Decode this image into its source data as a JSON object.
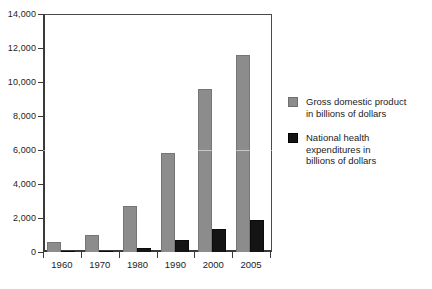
{
  "chart_data": {
    "type": "bar",
    "title": "",
    "subtitle": "",
    "xlabel": "",
    "ylabel": "",
    "categories": [
      "1960",
      "1970",
      "1980",
      "1990",
      "2000",
      "2005"
    ],
    "series": [
      {
        "name": "Gross domestic product in billions of dollars",
        "color": "#8c8c8c",
        "values": [
          600,
          1000,
          2700,
          5800,
          9600,
          11600
        ]
      },
      {
        "name": "National health expenditures in billions of dollars",
        "color": "#141414",
        "values": [
          27,
          75,
          250,
          700,
          1350,
          1900
        ]
      }
    ],
    "ylim": [
      0,
      14000
    ],
    "ytick_step": 2000,
    "ytick_labels": [
      "0",
      "2,000",
      "4,000",
      "6,000",
      "8,000",
      "10,000",
      "12,000",
      "14,000"
    ],
    "ytick_values": [
      0,
      2000,
      4000,
      6000,
      8000,
      10000,
      12000,
      14000
    ],
    "grid": false,
    "legend_position": "right"
  },
  "legend": {
    "entries": [
      {
        "swatch": "gray-square-swatch",
        "lines": [
          "Gross domestic product",
          "in billions of dollars"
        ]
      },
      {
        "swatch": "black-square-swatch",
        "lines": [
          "National health",
          "expenditures in",
          "billions of dollars"
        ]
      }
    ]
  }
}
